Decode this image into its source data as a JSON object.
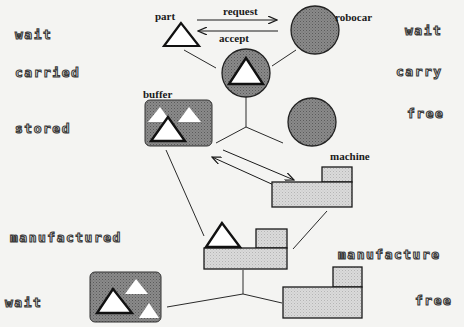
{
  "diagram": {
    "type": "state-transition diagram (Petri-net style)",
    "colors": {
      "background": "#f4f4f2",
      "dark_fill": "#7a7a7a",
      "light_fill": "#d4d4d4",
      "stroke": "#1a1a1a",
      "triangle_fill": "#ffffff"
    },
    "node_labels": {
      "part": "part",
      "robocar": "robocar",
      "buffer": "buffer",
      "machine": "machine"
    },
    "message_labels": {
      "request": "request",
      "accept": "accept"
    },
    "left_states": [
      {
        "id": "wait",
        "label": "wait"
      },
      {
        "id": "carried",
        "label": "carried"
      },
      {
        "id": "stored",
        "label": "stored"
      },
      {
        "id": "manufactured",
        "label": "manufactured"
      },
      {
        "id": "wait_bottom",
        "label": "wait"
      }
    ],
    "right_states": [
      {
        "id": "wait",
        "label": "wait"
      },
      {
        "id": "carry",
        "label": "carry"
      },
      {
        "id": "free",
        "label": "free"
      },
      {
        "id": "manufacture",
        "label": "manufacture"
      },
      {
        "id": "free_bottom",
        "label": "free"
      }
    ],
    "nodes": [
      {
        "id": "part",
        "shape": "triangle",
        "state": "wait"
      },
      {
        "id": "robocar",
        "shape": "dark-circle",
        "state": "wait"
      },
      {
        "id": "robocar-carrying-part",
        "shape": "dark-circle-with-triangle",
        "state": "carried / carry"
      },
      {
        "id": "robocar-free",
        "shape": "dark-circle",
        "state": "free"
      },
      {
        "id": "buffer",
        "shape": "dark-rounded-box-with-triangles",
        "state": "stored"
      },
      {
        "id": "machine",
        "shape": "light-L-block",
        "state": "wait"
      },
      {
        "id": "machine-with-part",
        "shape": "light-L-block-with-triangle",
        "state": "manufactured / manufacture"
      },
      {
        "id": "buffer-bottom",
        "shape": "dark-rounded-box-with-triangles",
        "state": "wait"
      },
      {
        "id": "machine-free",
        "shape": "light-L-block",
        "state": "free"
      }
    ]
  }
}
